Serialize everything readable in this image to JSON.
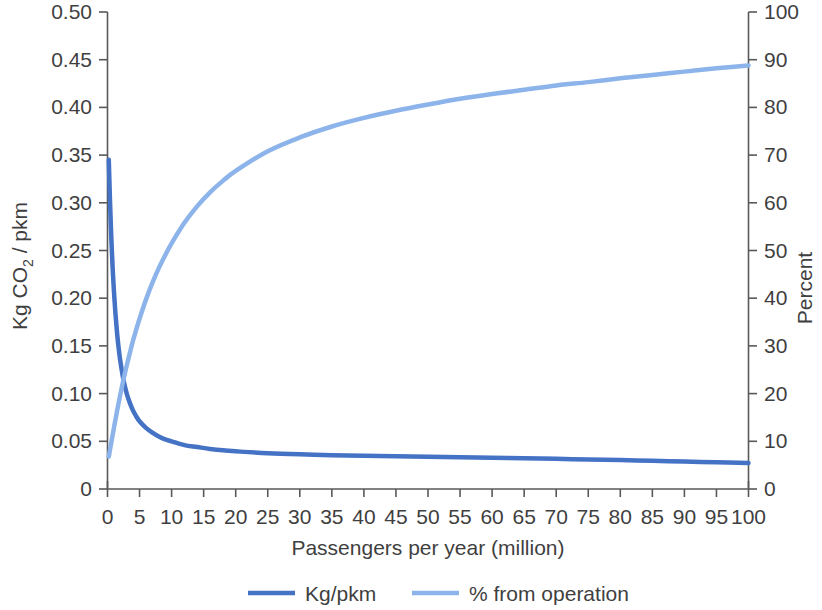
{
  "chart_data": {
    "type": "line",
    "title": "",
    "xlabel": "Passengers per year (million)",
    "ylabel": "Kg CO2 / pkm",
    "ylabel_parts": {
      "pre": "Kg CO",
      "sub": "2",
      "post": " / pkm"
    },
    "y2label": "Percent",
    "xlim": [
      0,
      100
    ],
    "ylim": [
      0,
      0.5
    ],
    "y2lim": [
      0,
      100
    ],
    "grid": false,
    "legend_position": "bottom",
    "x_ticks": [
      0,
      5,
      10,
      15,
      20,
      25,
      30,
      35,
      40,
      45,
      50,
      55,
      60,
      65,
      70,
      75,
      80,
      85,
      90,
      95,
      100
    ],
    "x_tick_labels": [
      "0",
      "5",
      "10",
      "15",
      "20",
      "25",
      "30",
      "35",
      "40",
      "45",
      "50",
      "55",
      "60",
      "65",
      "70",
      "75",
      "80",
      "85",
      "90",
      "95",
      "100"
    ],
    "y_ticks": [
      0,
      0.05,
      0.1,
      0.15,
      0.2,
      0.25,
      0.3,
      0.35,
      0.4,
      0.45,
      0.5
    ],
    "y_tick_labels": [
      "0",
      "0.05",
      "0.10",
      "0.15",
      "0.20",
      "0.25",
      "0.30",
      "0.35",
      "0.40",
      "0.45",
      "0.50"
    ],
    "y2_ticks": [
      0,
      10,
      20,
      30,
      40,
      50,
      60,
      70,
      80,
      90,
      100
    ],
    "y2_tick_labels": [
      "0",
      "10",
      "20",
      "30",
      "40",
      "50",
      "60",
      "70",
      "80",
      "90",
      "100"
    ],
    "series": [
      {
        "name": "Kg/pkm",
        "axis": "left",
        "color": "#4472C4",
        "width": 4.5,
        "x": [
          0.2,
          0.4,
          0.6,
          0.8,
          1,
          1.25,
          1.5,
          1.75,
          2,
          2.5,
          3,
          3.5,
          4,
          4.5,
          5,
          6,
          7,
          8,
          9,
          10,
          12,
          14,
          16,
          18,
          20,
          25,
          30,
          35,
          40,
          45,
          50,
          55,
          60,
          65,
          70,
          75,
          80,
          85,
          90,
          95,
          100
        ],
        "values": [
          0.345,
          0.3,
          0.262,
          0.232,
          0.208,
          0.183,
          0.163,
          0.147,
          0.134,
          0.114,
          0.1,
          0.09,
          0.082,
          0.076,
          0.071,
          0.064,
          0.059,
          0.055,
          0.052,
          0.05,
          0.046,
          0.044,
          0.042,
          0.0405,
          0.0395,
          0.0375,
          0.0363,
          0.0355,
          0.0348,
          0.0342,
          0.0337,
          0.0332,
          0.0327,
          0.0322,
          0.0316,
          0.031,
          0.0303,
          0.0296,
          0.0288,
          0.028,
          0.0272
        ]
      },
      {
        "name": "% from operation",
        "axis": "right",
        "color": "#8CB4EA",
        "width": 4.5,
        "x": [
          0.2,
          0.4,
          0.6,
          0.8,
          1,
          1.25,
          1.5,
          1.75,
          2,
          2.5,
          3,
          3.5,
          4,
          4.5,
          5,
          6,
          7,
          8,
          9,
          10,
          12,
          14,
          16,
          18,
          20,
          25,
          30,
          35,
          40,
          45,
          50,
          55,
          60,
          65,
          70,
          75,
          80,
          85,
          90,
          95,
          100
        ],
        "values": [
          6.8,
          8.3,
          9.8,
          11.3,
          12.8,
          14.6,
          16.4,
          18.1,
          19.8,
          23.0,
          25.9,
          28.6,
          31.2,
          33.5,
          35.7,
          39.7,
          43.2,
          46.3,
          49.0,
          51.5,
          55.8,
          59.3,
          62.2,
          64.6,
          66.7,
          70.8,
          73.7,
          76.0,
          77.8,
          79.3,
          80.6,
          81.8,
          82.8,
          83.7,
          84.6,
          85.3,
          86.1,
          86.8,
          87.5,
          88.2,
          88.8
        ]
      }
    ],
    "legend": [
      {
        "label": "Kg/pkm",
        "color": "#4472C4"
      },
      {
        "label": "% from operation",
        "color": "#8CB4EA"
      }
    ]
  },
  "accent_colors": {
    "dark_blue": "#4472C4",
    "light_blue": "#8CB4EA",
    "axis_gray": "#595959",
    "text_gray": "#3f3f3f",
    "background": "#ffffff"
  }
}
